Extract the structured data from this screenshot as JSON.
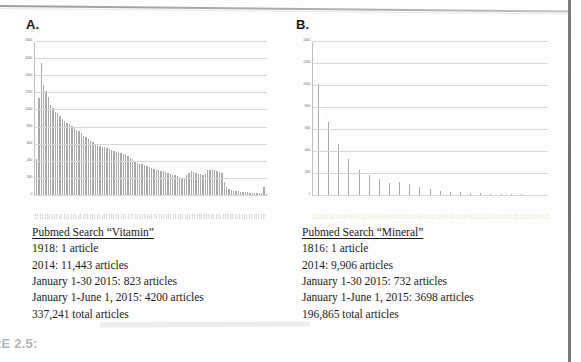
{
  "figure": {
    "bottom_caption": "RE 2.5:"
  },
  "panels": [
    {
      "label": "A.",
      "caption": {
        "title": "Pubmed Search “Vitamin”",
        "lines": [
          "1918: 1 article",
          "2014: 11,443 articles",
          "January 1-30 2015: 823 articles",
          "January 1-June 1, 2015: 4200 articles",
          "337,241 total articles"
        ]
      }
    },
    {
      "label": "B.",
      "caption": {
        "title": "Pubmed Search “Mineral”",
        "lines": [
          "1816: 1 article",
          "2014: 9,906 articles",
          "January 1-30 2015: 732 articles",
          "January 1-June 1, 2015: 3698 articles",
          "196,865 total articles"
        ]
      }
    }
  ],
  "chart_data": [
    {
      "type": "bar",
      "title": "A.",
      "xlabel": "",
      "ylabel": "",
      "ylim": [
        0,
        18000
      ],
      "yticks": [
        0,
        2000,
        4000,
        6000,
        8000,
        10000,
        12000,
        14000,
        16000,
        18000
      ],
      "ytick_labels": [
        "0",
        "2000",
        "4000",
        "6000",
        "8000",
        "10000",
        "12000",
        "14000",
        "16000",
        "18000"
      ],
      "grid": true,
      "legend": "none",
      "bar_color": "#a9a9a9",
      "categories": [
        "2015",
        "2014",
        "2013",
        "2012",
        "2011",
        "2010",
        "2009",
        "2008",
        "2007",
        "2006",
        "2005",
        "2004",
        "2003",
        "2002",
        "2001",
        "2000",
        "1999",
        "1998",
        "1997",
        "1996",
        "1995",
        "1994",
        "1993",
        "1992",
        "1991",
        "1990",
        "1989",
        "1988",
        "1987",
        "1986",
        "1985",
        "1984",
        "1983",
        "1982",
        "1981",
        "1980",
        "1979",
        "1978",
        "1977",
        "1976",
        "1975",
        "1974",
        "1973",
        "1972",
        "1971",
        "1970",
        "1969",
        "1968",
        "1967",
        "1966",
        "1965",
        "1964",
        "1963",
        "1962",
        "1961",
        "1960",
        "1959",
        "1958",
        "1957",
        "1956",
        "1955",
        "1954",
        "1953",
        "1952",
        "1951",
        "1950",
        "1949",
        "1948",
        "1947",
        "1946",
        "1945",
        "1944",
        "1943",
        "1942",
        "1941",
        "1940",
        "1939",
        "1938",
        "1937",
        "1936",
        "1935",
        "1934",
        "1933",
        "1932",
        "1931",
        "1930",
        "1929",
        "1928",
        "1927",
        "1926",
        "1925",
        "1924",
        "1923",
        "1922",
        "1921",
        "1920",
        "1919",
        "1918"
      ],
      "values": [
        4200,
        11443,
        15500,
        12900,
        12200,
        11500,
        10600,
        10200,
        9800,
        9600,
        9300,
        9000,
        8700,
        8500,
        8300,
        8100,
        7900,
        7700,
        7500,
        7300,
        7000,
        6800,
        6600,
        6400,
        6200,
        6000,
        5900,
        5800,
        5700,
        5600,
        5500,
        5400,
        5300,
        5200,
        5100,
        5000,
        4900,
        4850,
        4800,
        4600,
        4400,
        4200,
        4000,
        3800,
        3700,
        3600,
        3500,
        3400,
        3300,
        3200,
        3100,
        3000,
        2900,
        2850,
        2800,
        2700,
        2600,
        2500,
        2400,
        2300,
        2200,
        2100,
        2050,
        2000,
        2400,
        2600,
        2800,
        2700,
        2600,
        2500,
        2450,
        2400,
        2500,
        2900,
        3000,
        2950,
        2900,
        2800,
        2700,
        2600,
        1500,
        900,
        700,
        600,
        520,
        470,
        430,
        400,
        370,
        340,
        310,
        290,
        270,
        250,
        230,
        210,
        190,
        1000,
        80
      ]
    },
    {
      "type": "bar",
      "title": "B.",
      "xlabel": "",
      "ylabel": "",
      "ylim": [
        0,
        14000
      ],
      "yticks": [
        0,
        2000,
        4000,
        6000,
        8000,
        10000,
        12000,
        14000
      ],
      "ytick_labels": [
        "0",
        "2000",
        "4000",
        "6000",
        "8000",
        "10000",
        "12000",
        "14000"
      ],
      "grid": true,
      "legend": "none",
      "bar_color": "#a9a9a9",
      "categories": [
        "2015",
        "2014",
        "2013",
        "2012",
        "2011",
        "2010",
        "2009",
        "2008",
        "2007",
        "2006",
        "2005",
        "2004",
        "2003",
        "2002",
        "2001",
        "2000",
        "1999",
        "1998",
        "1997",
        "1996",
        "1995",
        "1994",
        "1993",
        "1992",
        "1991",
        "1990",
        "1989",
        "1988",
        "1987",
        "1986",
        "1985",
        "1984",
        "1983",
        "1982",
        "1981",
        "1980",
        "1979",
        "1978",
        "1977",
        "1976",
        "1975",
        "1974",
        "1973",
        "1972",
        "1971",
        "1970",
        "1969",
        "1968",
        "1967",
        "1966",
        "1965",
        "1964",
        "1963",
        "1962",
        "1961",
        "1960",
        "1959",
        "1958",
        "1957",
        "1956",
        "1955",
        "1954",
        "1953",
        "1952",
        "1951",
        "1950",
        "1949",
        "1948",
        "1947",
        "1946",
        "1945",
        "1944",
        "1943",
        "1942",
        "1941",
        "1940",
        "1939",
        "1938",
        "1937",
        "1936",
        "1935",
        "1934",
        "1933",
        "1932",
        "1931",
        "1930",
        "1929",
        "1928",
        "1927",
        "1926",
        "1925",
        "1924",
        "1923",
        "1922",
        "1921",
        "1920",
        "1919",
        "1918",
        "1917",
        "1916",
        "1915",
        "1914",
        "1913",
        "1912",
        "1911",
        "1910",
        "1909",
        "1908",
        "1907",
        "1906",
        "1905",
        "1904",
        "1903",
        "1902",
        "1901",
        "1900",
        "1899",
        "1898",
        "1897",
        "1896",
        "1895",
        "1894",
        "1893",
        "1892",
        "1891",
        "1890",
        "1889",
        "1888",
        "1887",
        "1886",
        "1885",
        "1884",
        "1883",
        "1882",
        "1881",
        "1880",
        "1879",
        "1878",
        "1877",
        "1876",
        "1875",
        "1874",
        "1873",
        "1872",
        "1871",
        "1870",
        "1869",
        "1868",
        "1867",
        "1866",
        "1865",
        "1864",
        "1863",
        "1862",
        "1861",
        "1860",
        "1859",
        "1858",
        "1857",
        "1856",
        "1855",
        "1854",
        "1853",
        "1852",
        "1851",
        "1850",
        "1849",
        "1848",
        "1847",
        "1846",
        "1845",
        "1844",
        "1843",
        "1842",
        "1841",
        "1840",
        "1839",
        "1838",
        "1837",
        "1836",
        "1835",
        "1834",
        "1833",
        "1832",
        "1831",
        "1830",
        "1829",
        "1828",
        "1827",
        "1826",
        "1825",
        "1824",
        "1823",
        "1822",
        "1821",
        "1820",
        "1819",
        "1818",
        "1817",
        "1816"
      ],
      "values": [
        3698,
        9906,
        13200,
        11000,
        10200,
        9600,
        9000,
        8600,
        8200,
        7900,
        7600,
        7300,
        7000,
        6700,
        6400,
        6100,
        5900,
        5700,
        5500,
        5300,
        5100,
        4900,
        4700,
        4500,
        4300,
        4100,
        3950,
        3800,
        3650,
        3500,
        3400,
        3300,
        3200,
        3100,
        3000,
        2900,
        2800,
        2700,
        2600,
        2500,
        2400,
        2300,
        2250,
        2200,
        2150,
        2100,
        2050,
        2000,
        1950,
        1900,
        1850,
        1800,
        1750,
        1700,
        1650,
        1600,
        1560,
        1520,
        1480,
        1440,
        1400,
        1360,
        1320,
        1280,
        1240,
        1200,
        1180,
        1160,
        1140,
        1120,
        1100,
        1080,
        1060,
        1040,
        1020,
        1000,
        1100,
        1200,
        1250,
        1300,
        1280,
        1240,
        1200,
        1150,
        1100,
        1050,
        1000,
        960,
        920,
        880,
        840,
        800,
        780,
        760,
        740,
        720,
        700,
        680,
        660,
        640,
        620,
        600,
        580,
        560,
        540,
        520,
        500,
        480,
        470,
        460,
        450,
        440,
        430,
        420,
        410,
        400,
        390,
        380,
        370,
        360,
        350,
        340,
        330,
        320,
        310,
        300,
        295,
        290,
        285,
        280,
        275,
        270,
        265,
        260,
        255,
        250,
        245,
        240,
        235,
        230,
        225,
        220,
        215,
        210,
        205,
        200,
        195,
        190,
        185,
        180,
        175,
        170,
        165,
        160,
        155,
        150,
        145,
        140,
        135,
        130,
        125,
        120,
        118,
        115,
        112,
        110,
        108,
        105,
        102,
        100,
        98,
        95,
        92,
        90,
        88,
        85,
        82,
        80,
        78,
        75,
        72,
        70,
        68,
        65,
        62,
        60,
        58,
        55,
        52,
        50,
        48,
        45,
        42,
        40,
        38,
        35,
        32,
        30,
        28,
        25,
        22,
        20,
        18,
        15,
        12,
        10,
        8,
        6,
        5,
        4,
        3,
        2,
        1
      ]
    }
  ]
}
